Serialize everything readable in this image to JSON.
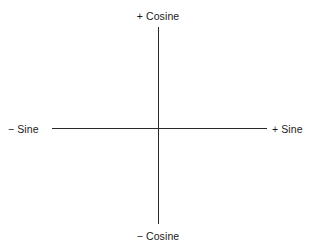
{
  "diagram": {
    "type": "axes",
    "labels": {
      "top": "+ Cosine",
      "bottom": "− Cosine",
      "left": "− Sine",
      "right": "+ Sine"
    },
    "axes": {
      "horizontal": {
        "negative": "− Sine",
        "positive": "+ Sine"
      },
      "vertical": {
        "negative": "− Cosine",
        "positive": "+ Cosine"
      }
    },
    "colors": {
      "line": "#2a2a2a",
      "text": "#1a1a1a",
      "background": "#ffffff"
    }
  }
}
